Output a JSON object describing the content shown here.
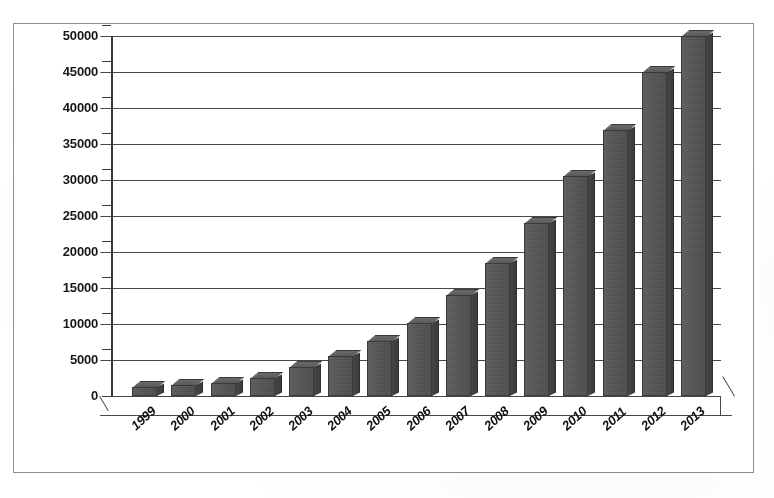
{
  "chart_data": {
    "type": "bar",
    "title": "",
    "subtitle": "",
    "xlabel": "",
    "ylabel": "",
    "categories": [
      "1999",
      "2000",
      "2001",
      "2002",
      "2003",
      "2004",
      "2005",
      "2006",
      "2007",
      "2008",
      "2009",
      "2010",
      "2011",
      "2012",
      "2013"
    ],
    "values": [
      1300,
      1500,
      1800,
      2500,
      4000,
      5600,
      7700,
      10200,
      14000,
      18500,
      24000,
      30500,
      37000,
      45000,
      50000
    ],
    "series": [
      {
        "name": "",
        "values": [
          1300,
          1500,
          1800,
          2500,
          4000,
          5600,
          7700,
          10200,
          14000,
          18500,
          24000,
          30500,
          37000,
          45000,
          50000
        ]
      }
    ],
    "ylim": [
      0,
      50000
    ],
    "ytick_step": 5000,
    "yticks": [
      "50000",
      "45000",
      "40000",
      "35000",
      "30000",
      "25000",
      "20000",
      "15000",
      "10000",
      "5000",
      "0"
    ],
    "ytick_values": [
      50000,
      45000,
      40000,
      35000,
      30000,
      25000,
      20000,
      15000,
      10000,
      5000,
      0
    ],
    "grid": true,
    "grid_axis": "y",
    "legend": false,
    "legend_position": "none",
    "style": "3d-column",
    "bar_color": "#565656",
    "bar_side_color": "#3f3f3f",
    "grid_color": "#4a4a4a",
    "axis_color": "#3a3a3a",
    "background_color": "#ffffff",
    "annotations": []
  }
}
